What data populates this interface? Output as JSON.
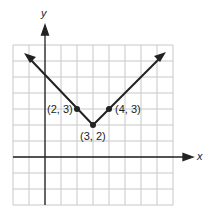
{
  "figure": {
    "axis_labels": {
      "x": "x",
      "y": "y"
    },
    "grid": {
      "cols": 10,
      "rows": 10,
      "cell_px": 16,
      "x_min": -2,
      "x_max": 8,
      "y_min": -3,
      "y_max": 7
    },
    "points": [
      {
        "label": "(2, 3)",
        "x": 2,
        "y": 3
      },
      {
        "label": "(3, 2)",
        "x": 3,
        "y": 2
      },
      {
        "label": "(4, 3)",
        "x": 4,
        "y": 3
      }
    ],
    "line_color": "#222222",
    "grid_color": "#c8c8c8"
  }
}
